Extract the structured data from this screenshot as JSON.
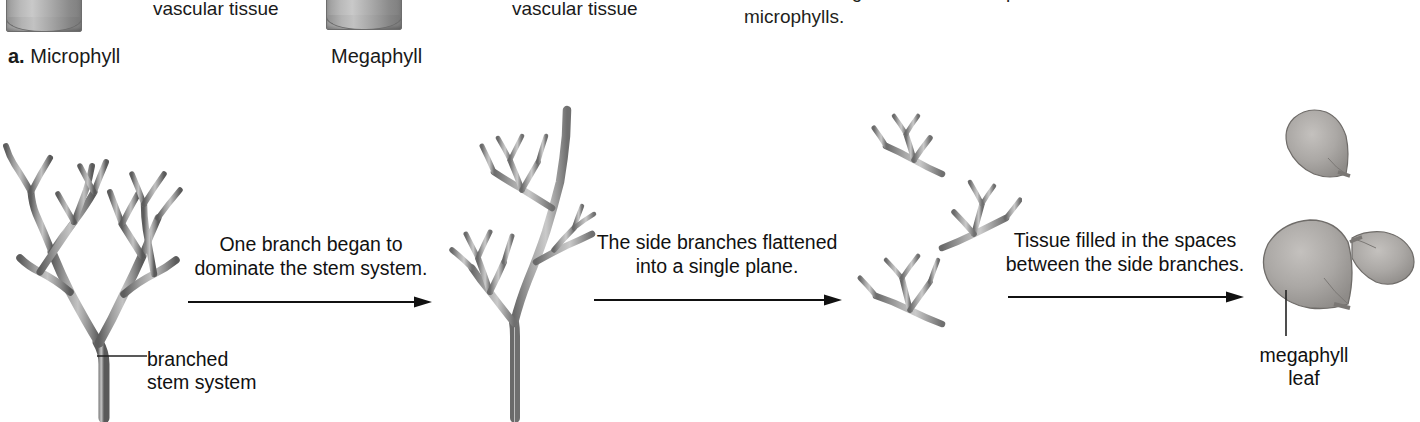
{
  "header": {
    "microphyll": {
      "enumerator": "a.",
      "label": " Microphyll",
      "vascular_tissue_label": "vascular tissue",
      "icon": "stem-cylinder-icon"
    },
    "megaphyll": {
      "label": "Megaphyll",
      "vascular_tissue_label": "vascular tissue",
      "icon": "stem-cylinder-icon"
    },
    "body_copy": {
      "line_clipped": "which are larger and more complex than",
      "line_visible": "microphylls."
    }
  },
  "stages": [
    {
      "id": "stage-1",
      "art_name": "branched-stem-system-illustration",
      "callout": {
        "line1": "branched",
        "line2": "stem system"
      }
    },
    {
      "id": "stage-2",
      "art_name": "dominant-stem-illustration"
    },
    {
      "id": "stage-3",
      "art_name": "flattened-side-branches-illustration"
    },
    {
      "id": "stage-4",
      "art_name": "megaphyll-leaf-illustration",
      "callout": {
        "line1": "megaphyll",
        "line2": "leaf"
      }
    }
  ],
  "captions": [
    {
      "id": "caption-1",
      "line1": "One branch began to",
      "line2": "dominate the stem system."
    },
    {
      "id": "caption-2",
      "line1": "The side branches flattened",
      "line2": "into a single plane."
    },
    {
      "id": "caption-3",
      "line1": "Tissue filled in the spaces",
      "line2": "between the side branches."
    }
  ],
  "arrows": [
    {
      "id": "arrow-1",
      "direction": "right"
    },
    {
      "id": "arrow-2",
      "direction": "right"
    },
    {
      "id": "arrow-3",
      "direction": "right"
    }
  ],
  "colors": {
    "background": "#ffffff",
    "text": "#1a1a1a",
    "stem_dark": "#4a4a4a",
    "stem_mid": "#8c8c8c",
    "stem_light": "#c2c2c2",
    "leaf_fill": "#a8a5a2",
    "arrow": "#111111"
  }
}
